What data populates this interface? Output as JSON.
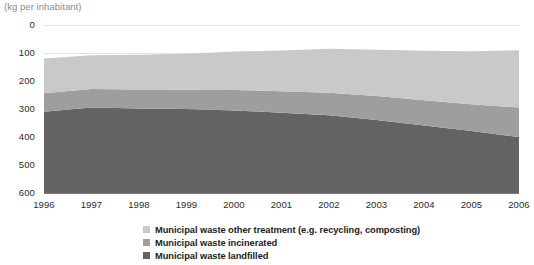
{
  "header": {
    "clipped_title_fragment": "",
    "unit_caption": "(kg per inhabitant)"
  },
  "axes": {
    "y_ticks": [
      "600",
      "500",
      "400",
      "300",
      "200",
      "100",
      "0"
    ],
    "x_ticks": [
      "1996",
      "1997",
      "1998",
      "1999",
      "2000",
      "2001",
      "2002",
      "2003",
      "2004",
      "2005",
      "2006"
    ]
  },
  "legend": {
    "items": [
      {
        "label": "Municipal waste other treatment (e.g. recycling, composting)",
        "color": "#c9c9c9",
        "name": "legend-other-treatment"
      },
      {
        "label": "Municipal waste incinerated",
        "color": "#9e9e9e",
        "name": "legend-incinerated"
      },
      {
        "label": "Municipal waste landfilled",
        "color": "#636363",
        "name": "legend-landfilled"
      }
    ]
  },
  "colors": {
    "band_other_treatment": "#c9c9c9",
    "band_incinerated": "#9e9e9e",
    "band_landfilled": "#636363",
    "gridline": "#e3e3e3",
    "axis_text": "#2b2b2b",
    "caption_text": "#8c8c8c",
    "background": "#ffffff"
  },
  "chart_data": {
    "type": "area",
    "stacked": true,
    "title": "(kg per inhabitant)",
    "subtitle": "",
    "xlabel": "",
    "ylabel": "kg per inhabitant",
    "x": [
      1996,
      1997,
      1998,
      1999,
      2000,
      2001,
      2002,
      2003,
      2004,
      2005,
      2006
    ],
    "categories": [
      "1996",
      "1997",
      "1998",
      "1999",
      "2000",
      "2001",
      "2002",
      "2003",
      "2004",
      "2005",
      "2006"
    ],
    "ylim": [
      0,
      600
    ],
    "y_ticks": [
      0,
      100,
      200,
      300,
      400,
      500,
      600
    ],
    "grid": true,
    "grid_axis": "y",
    "legend_position": "bottom-center",
    "series": [
      {
        "name": "Municipal waste landfilled",
        "color": "#636363",
        "stack_order": 1,
        "values": [
          290,
          305,
          302,
          300,
          295,
          287,
          278,
          261,
          241,
          221,
          200
        ]
      },
      {
        "name": "Municipal waste incinerated",
        "color": "#9e9e9e",
        "stack_order": 2,
        "values": [
          66,
          66,
          68,
          69,
          73,
          76,
          80,
          85,
          90,
          96,
          105
        ]
      },
      {
        "name": "Municipal waste other treatment (e.g. recycling, composting)",
        "color": "#c9c9c9",
        "stack_order": 3,
        "values": [
          124,
          121,
          124,
          128,
          137,
          146,
          157,
          166,
          177,
          189,
          205
        ]
      }
    ],
    "cumulative_landfilled": [
      290,
      305,
      302,
      300,
      295,
      287,
      278,
      261,
      241,
      221,
      200
    ],
    "cumulative_landfilled_plus_incinerated": [
      356,
      371,
      370,
      369,
      368,
      363,
      358,
      346,
      331,
      317,
      305
    ],
    "cumulative_total": [
      480,
      492,
      494,
      497,
      505,
      509,
      515,
      512,
      508,
      506,
      510
    ]
  }
}
